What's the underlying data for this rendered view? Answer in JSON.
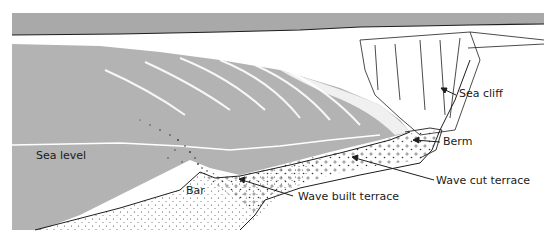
{
  "diagram": {
    "colors": {
      "sky": "#a9a9a9",
      "sea": "#b3b3b3",
      "land": "#ffffff",
      "line": "#1e1e1e",
      "sea_level_line": "#ffffff",
      "sediment_dots": "#333333"
    },
    "labels": {
      "sea_cliff": "Sea cliff",
      "berm": "Berm",
      "sea_level": "Sea level",
      "bar": "Bar",
      "wave_cut_terrace": "Wave cut terrace",
      "wave_built_terrace": "Wave built terrace"
    }
  }
}
